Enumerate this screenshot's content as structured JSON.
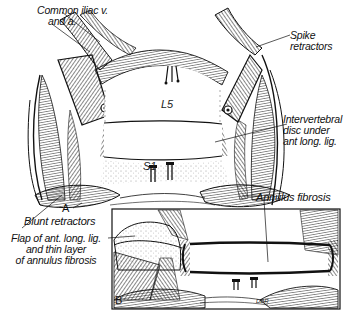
{
  "figure": {
    "type": "surgical illustration",
    "style": "black-and-white line drawing",
    "panels": [
      {
        "id": "A",
        "letter": "A",
        "description": "Anterior exposure of lumbosacral disc with retractors",
        "vertebrae": {
          "upper": "L5",
          "lower": "S1"
        }
      },
      {
        "id": "B",
        "letter": "B",
        "description": "Close-up with flap reflected",
        "signature": "DBR"
      }
    ],
    "labels": {
      "common_iliac_line1": "Common iliac v.",
      "common_iliac_line2": "and a.",
      "spike_line1": "Spike",
      "spike_line2": "retractors",
      "disc_line1": "Intervertebral",
      "disc_line2": "disc under",
      "disc_line3": "ant long. lig.",
      "blunt": "Blunt retractors",
      "annulus": "Annulus fibrosis",
      "flap_line1": "Flap of ant. long. lig.",
      "flap_line2": "and thin layer",
      "flap_line3": "of annulus fibrosis"
    },
    "colors": {
      "ink": "#111111",
      "paper": "#ffffff"
    }
  }
}
